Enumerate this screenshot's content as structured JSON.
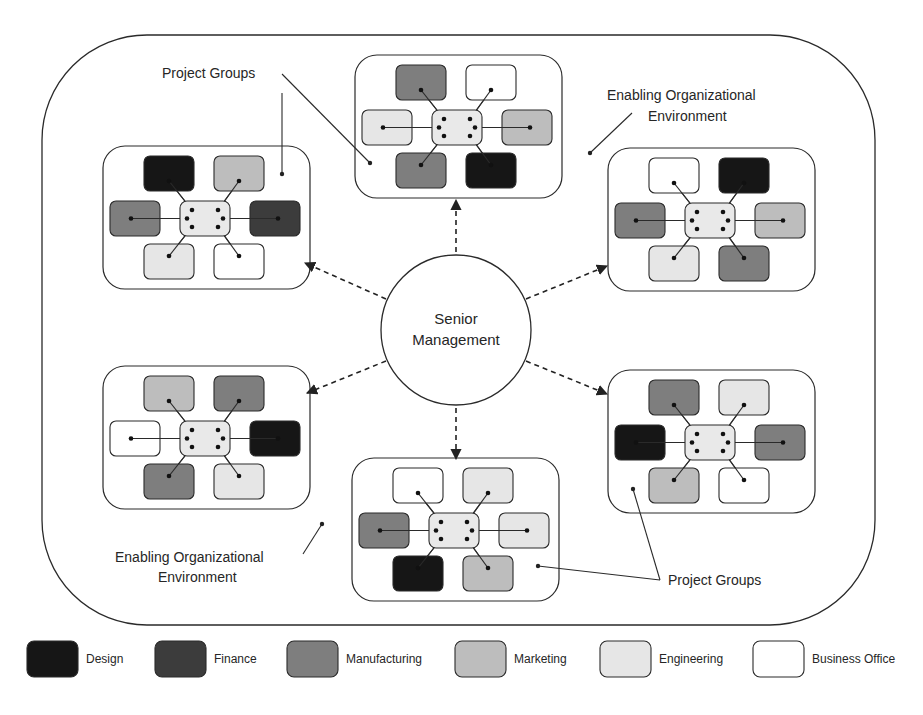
{
  "palette": {
    "design": "#161616",
    "finance": "#3c3c3c",
    "manufacturing": "#7e7e7e",
    "marketing": "#bdbdbd",
    "engineering": "#e6e6e6",
    "business_office": "#ffffff",
    "hub": "#e9e9e9",
    "stroke": "#2a2a2a"
  },
  "center": {
    "line1": "Senior",
    "line2": "Management"
  },
  "labels": {
    "project_groups_top": "Project Groups",
    "env_top_line1": "Enabling Organizational",
    "env_top_line2": "Environment",
    "env_bottom_line1": "Enabling Organizational",
    "env_bottom_line2": "Environment",
    "project_groups_bottom": "Project Groups"
  },
  "groups": [
    {
      "id": "top",
      "x": 355,
      "y": 55,
      "units": [
        "manufacturing",
        "business_office",
        "engineering",
        "marketing",
        "manufacturing",
        "design"
      ]
    },
    {
      "id": "top-left",
      "x": 103,
      "y": 146,
      "units": [
        "design",
        "marketing",
        "manufacturing",
        "finance",
        "engineering",
        "business_office"
      ]
    },
    {
      "id": "top-right",
      "x": 608,
      "y": 148,
      "units": [
        "business_office",
        "design",
        "manufacturing",
        "marketing",
        "engineering",
        "manufacturing"
      ]
    },
    {
      "id": "bottom-left",
      "x": 103,
      "y": 366,
      "units": [
        "marketing",
        "manufacturing",
        "business_office",
        "design",
        "manufacturing",
        "engineering"
      ]
    },
    {
      "id": "bottom-right",
      "x": 608,
      "y": 370,
      "units": [
        "manufacturing",
        "engineering",
        "design",
        "manufacturing",
        "marketing",
        "business_office"
      ]
    },
    {
      "id": "bottom",
      "x": 352,
      "y": 458,
      "units": [
        "business_office",
        "engineering",
        "manufacturing",
        "engineering",
        "design",
        "marketing"
      ]
    }
  ],
  "legend": [
    {
      "key": "design",
      "label": "Design",
      "x": 27
    },
    {
      "key": "finance",
      "label": "Finance",
      "x": 155
    },
    {
      "key": "manufacturing",
      "label": "Manufacturing",
      "x": 287
    },
    {
      "key": "marketing",
      "label": "Marketing",
      "x": 455
    },
    {
      "key": "engineering",
      "label": "Engineering",
      "x": 600
    },
    {
      "key": "business_office",
      "label": "Business Office",
      "x": 753
    }
  ]
}
